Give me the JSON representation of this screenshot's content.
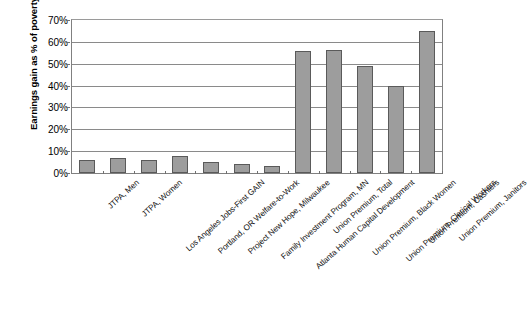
{
  "chart_data": {
    "type": "bar",
    "title": "",
    "subtitle": "",
    "xlabel": "",
    "ylabel": "Earnings gain as % of poverty",
    "ylim": [
      0,
      70
    ],
    "ytick_labels": [
      "0%",
      "10%",
      "20%",
      "30%",
      "40%",
      "50%",
      "60%",
      "70%"
    ],
    "ytick_values": [
      0,
      10,
      20,
      30,
      40,
      50,
      60,
      70
    ],
    "grid": true,
    "legend": "none",
    "bar_color": "#9d9d9d",
    "bar_border_color": "#5a5a5a",
    "categories": [
      "JTPA, Men",
      "JTPA, Women",
      "Los Angeles Jobs-First GAIN",
      "Portland, OR Welfare-to-Work",
      "Project New Hope, Milwaukee",
      "Family Investment Program, MN",
      "Atlanta Human Capital Development",
      "Union Premium, Total",
      "Union Premium, Black Women",
      "Union Premium, Clerical Workers",
      "Union Premium, Cashiers",
      "Union Premium, Janitors"
    ],
    "values": [
      6,
      7,
      6,
      8,
      5,
      4,
      3,
      56,
      56.5,
      49,
      40,
      65
    ]
  }
}
